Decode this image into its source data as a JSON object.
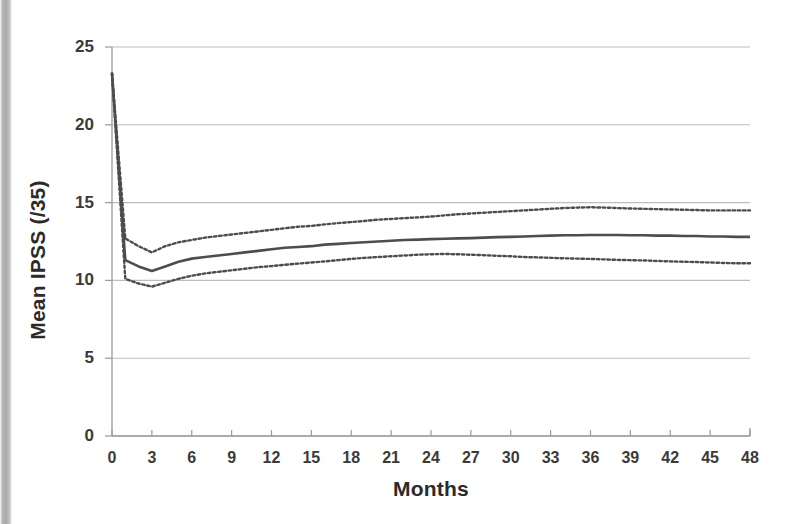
{
  "chart_data": {
    "type": "line",
    "title": "",
    "subtitle": "",
    "xlabel": "Months",
    "ylabel": "Mean IPSS (/35)",
    "xlim": [
      0,
      48
    ],
    "ylim": [
      0,
      25
    ],
    "y_ticks": [
      0,
      5,
      10,
      15,
      20,
      25
    ],
    "x_ticks": [
      0,
      3,
      6,
      9,
      12,
      15,
      18,
      21,
      24,
      27,
      30,
      33,
      36,
      39,
      42,
      45,
      48
    ],
    "grid": "horizontal",
    "legend": "none",
    "annotations": [],
    "x": [
      0,
      1,
      2,
      3,
      4,
      5,
      6,
      7,
      8,
      9,
      10,
      11,
      12,
      13,
      14,
      15,
      16,
      17,
      18,
      19,
      20,
      21,
      22,
      23,
      24,
      25,
      26,
      27,
      28,
      29,
      30,
      31,
      32,
      33,
      34,
      35,
      36,
      37,
      38,
      39,
      40,
      41,
      42,
      43,
      44,
      45,
      46,
      47,
      48
    ],
    "series": [
      {
        "name": "Mean IPSS",
        "style": "solid",
        "color": "#4d4d4d",
        "width": 2.6,
        "values": [
          23.3,
          11.3,
          10.9,
          10.6,
          10.9,
          11.2,
          11.4,
          11.5,
          11.6,
          11.7,
          11.8,
          11.9,
          12.0,
          12.1,
          12.15,
          12.2,
          12.3,
          12.35,
          12.4,
          12.45,
          12.5,
          12.55,
          12.6,
          12.62,
          12.65,
          12.68,
          12.7,
          12.72,
          12.75,
          12.78,
          12.8,
          12.82,
          12.85,
          12.88,
          12.9,
          12.9,
          12.92,
          12.92,
          12.92,
          12.9,
          12.9,
          12.88,
          12.88,
          12.85,
          12.85,
          12.82,
          12.82,
          12.8,
          12.8
        ]
      },
      {
        "name": "Upper 95% CI",
        "style": "dotted",
        "color": "#4d4d4d",
        "width": 2.4,
        "values": [
          23.3,
          12.7,
          12.2,
          11.8,
          12.2,
          12.45,
          12.6,
          12.75,
          12.85,
          12.95,
          13.05,
          13.15,
          13.25,
          13.35,
          13.45,
          13.5,
          13.6,
          13.68,
          13.75,
          13.82,
          13.9,
          13.95,
          14.0,
          14.05,
          14.1,
          14.18,
          14.25,
          14.3,
          14.35,
          14.4,
          14.45,
          14.5,
          14.55,
          14.6,
          14.65,
          14.68,
          14.7,
          14.68,
          14.65,
          14.62,
          14.6,
          14.58,
          14.56,
          14.54,
          14.52,
          14.5,
          14.5,
          14.5,
          14.5
        ]
      },
      {
        "name": "Lower 95% CI",
        "style": "dotted",
        "color": "#4d4d4d",
        "width": 2.4,
        "values": [
          23.3,
          10.1,
          9.8,
          9.6,
          9.85,
          10.1,
          10.3,
          10.45,
          10.55,
          10.65,
          10.75,
          10.85,
          10.92,
          11.0,
          11.08,
          11.15,
          11.22,
          11.3,
          11.38,
          11.45,
          11.5,
          11.55,
          11.6,
          11.65,
          11.68,
          11.7,
          11.68,
          11.65,
          11.62,
          11.58,
          11.55,
          11.5,
          11.48,
          11.45,
          11.42,
          11.4,
          11.38,
          11.35,
          11.32,
          11.3,
          11.28,
          11.25,
          11.22,
          11.2,
          11.18,
          11.15,
          11.12,
          11.1,
          11.1
        ]
      }
    ]
  },
  "axes": {
    "y_title": "Mean IPSS (/35)",
    "x_title": "Months",
    "y_tick_labels": [
      "25",
      "20",
      "15",
      "10",
      "5",
      "0"
    ],
    "x_tick_labels": [
      "0",
      "3",
      "6",
      "9",
      "12",
      "15",
      "18",
      "21",
      "24",
      "27",
      "30",
      "33",
      "36",
      "39",
      "42",
      "45",
      "48"
    ]
  },
  "colors": {
    "gridline": "#bdbdbd",
    "axis": "#9a9a9a",
    "series": "#4d4d4d",
    "tick_text": "#3a3a3a",
    "title_text": "#2b2b2b",
    "background": "#ffffff"
  }
}
